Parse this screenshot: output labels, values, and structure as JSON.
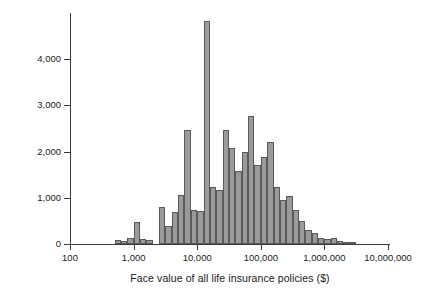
{
  "chart_data": {
    "type": "bar",
    "title": "",
    "subtitle": "",
    "xlabel": "Face value of all life insurance policies ($)",
    "ylabel": "Number of respondents",
    "xscale": "log",
    "xlim": [
      100,
      10000000
    ],
    "ylim": [
      0,
      5000
    ],
    "grid": false,
    "legend": null,
    "bar_color": "#9a9a9a",
    "bar_edge_color": "#5a5a5a",
    "axis_color": "#3a3a3a",
    "xticks": [
      {
        "value": 100,
        "label": "100"
      },
      {
        "value": 1000,
        "label": "1,000"
      },
      {
        "value": 10000,
        "label": "10,000"
      },
      {
        "value": 100000,
        "label": "100,000"
      },
      {
        "value": 1000000,
        "label": "1,000,000"
      },
      {
        "value": 10000000,
        "label": "10,000,000"
      }
    ],
    "yticks": [
      {
        "value": 0,
        "label": "0"
      },
      {
        "value": 1000,
        "label": "1,000"
      },
      {
        "value": 2000,
        "label": "2,000"
      },
      {
        "value": 3000,
        "label": "3,000"
      },
      {
        "value": 4000,
        "label": "4,000"
      }
    ],
    "bins_per_decade": 10,
    "bin_left_edges": [
      100,
      125.9,
      158.5,
      199.5,
      251.2,
      316.2,
      398.1,
      501.2,
      631.0,
      794.3,
      1000,
      1259,
      1585,
      1995,
      2512,
      3162,
      3981,
      5012,
      6310,
      7943,
      10000,
      12590,
      15850,
      19950,
      25120,
      31620,
      39810,
      50120,
      63100,
      79430,
      100000,
      125900,
      158500,
      199500,
      251200,
      316200,
      398100,
      501200,
      631000,
      794300,
      1000000,
      1259000,
      1585000,
      1995000,
      2512000,
      3162000,
      3981000,
      5012000,
      6310000,
      7943000
    ],
    "values": [
      0,
      0,
      0,
      0,
      0,
      0,
      0,
      90,
      60,
      130,
      480,
      110,
      90,
      0,
      800,
      400,
      690,
      1060,
      2470,
      740,
      720,
      4820,
      1240,
      1160,
      2470,
      2080,
      1580,
      1990,
      2760,
      1720,
      1880,
      2200,
      1240,
      950,
      1030,
      730,
      490,
      310,
      230,
      120,
      100,
      140,
      60,
      50,
      50,
      0,
      0,
      0,
      0,
      0
    ]
  },
  "figure": {
    "width": 423,
    "height": 296,
    "background": "#ffffff"
  }
}
